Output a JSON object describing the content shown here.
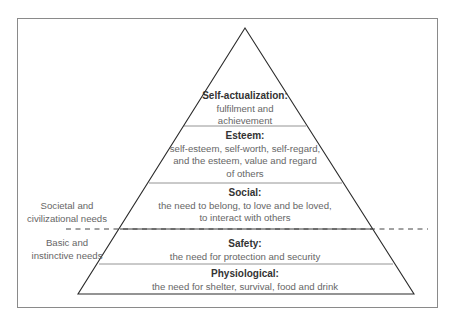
{
  "diagram": {
    "type": "pyramid",
    "levels": [
      {
        "id": "self-actualization",
        "title": "Self-actualization:",
        "description_lines": [
          "fulfilment and",
          "achievement"
        ]
      },
      {
        "id": "esteem",
        "title": "Esteem:",
        "description_lines": [
          "self-esteem, self-worth, self-regard,",
          "and the esteem, value and regard",
          "of others"
        ]
      },
      {
        "id": "social",
        "title": "Social:",
        "description_lines": [
          "the need to belong, to love and be loved,",
          "to interact with others"
        ]
      },
      {
        "id": "safety",
        "title": "Safety:",
        "description_lines": [
          "the need for protection and security"
        ]
      },
      {
        "id": "physiological",
        "title": "Physiological:",
        "description_lines": [
          "the need for shelter, survival, food and drink"
        ]
      }
    ],
    "side_labels": {
      "upper": [
        "Societal and",
        "civilizational needs"
      ],
      "lower": [
        "Basic and",
        "instinctive needs"
      ]
    },
    "colors": {
      "outline": "#2b2b2b",
      "divider": "#888888",
      "frame": "#8a8a8a",
      "title_text": "#333333",
      "body_text": "#666666",
      "dashed_line": "#444444"
    }
  }
}
